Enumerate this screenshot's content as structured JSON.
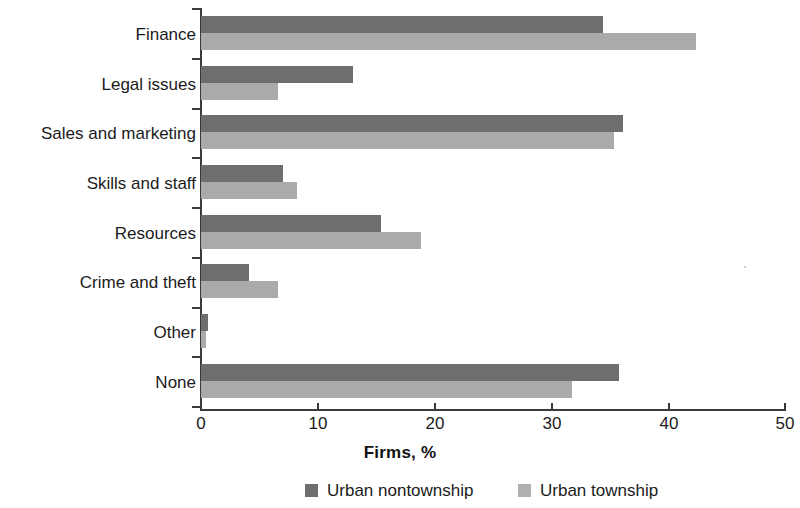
{
  "chart_data": {
    "type": "bar",
    "orientation": "horizontal",
    "title": "",
    "xlabel": "Firms, %",
    "ylabel": "",
    "xlim": [
      0,
      50
    ],
    "xticks": [
      0,
      10,
      20,
      30,
      40,
      50
    ],
    "xtick_labels": [
      "0",
      "10",
      "20",
      "30",
      "40",
      "50"
    ],
    "grid": false,
    "legend_position": "bottom",
    "categories": [
      "Finance",
      "Legal issues",
      "Sales and marketing",
      "Skills and staff",
      "Resources",
      "Crime and theft",
      "Other",
      "None"
    ],
    "series": [
      {
        "name": "Urban nontownship",
        "color": "#6e6e6e",
        "values": [
          34.4,
          13.0,
          36.1,
          7.0,
          15.4,
          4.1,
          0.6,
          35.8
        ]
      },
      {
        "name": "Urban township",
        "color": "#aaaaaa",
        "values": [
          42.4,
          6.6,
          35.4,
          8.2,
          18.8,
          6.6,
          0.4,
          31.8
        ]
      }
    ]
  },
  "legend": {
    "items": [
      {
        "label": "Urban nontownship",
        "swatch": "legend-swatch-dark"
      },
      {
        "label": "Urban township",
        "swatch": "legend-swatch-light"
      }
    ]
  }
}
